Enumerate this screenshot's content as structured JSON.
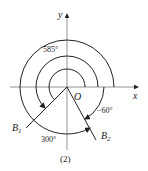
{
  "diagram": {
    "axes": {
      "x_label": "x",
      "y_label": "y",
      "origin_label": "O"
    },
    "rays": [
      {
        "label": "B1",
        "sub": "1",
        "base": "B"
      },
      {
        "label": "B2",
        "sub": "2",
        "base": "B"
      }
    ],
    "angles": [
      {
        "label": "585°",
        "value": 585,
        "direction": "counterclockwise",
        "terminal": "B1"
      },
      {
        "label": "300°",
        "value": 300,
        "direction": "counterclockwise",
        "terminal": "B2"
      },
      {
        "label": "−60°",
        "value": -60,
        "direction": "clockwise",
        "terminal": "B2"
      }
    ],
    "caption": "(2)"
  }
}
